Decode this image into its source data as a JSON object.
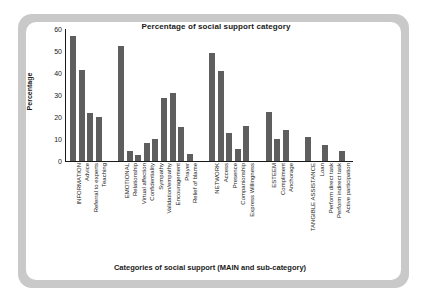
{
  "figure": {
    "background_color": "#ffffff",
    "frame_color": "#c9c9c9",
    "bar_color": "#5e5e5e",
    "axis_color": "#1a1a1a"
  },
  "chart_data": {
    "type": "bar",
    "title": "Percentage of social support category",
    "xlabel": "Categories of social support (MAIN and sub-category)",
    "ylabel": "Percentage",
    "ylim": [
      0,
      60
    ],
    "yticks": [
      0,
      10,
      20,
      30,
      40,
      50,
      60
    ],
    "grid": false,
    "legend": false,
    "categories": [
      "INFORMATION",
      "Advice",
      "Referral to experts",
      "Teaching",
      "EMOTIONAL",
      "Relationship",
      "Virtual affection",
      "Confidentiality",
      "Sympathy",
      "Validation/empathy",
      "Encouragement",
      "Prayer",
      "Relief of blame",
      "NETWORK",
      "Access",
      "Presence",
      "Companionship",
      "Express Willingness",
      "ESTEEM",
      "Compliment",
      "Anchorage",
      "TANGIBLE ASSISTANCE",
      "Loan",
      "Perform direct task",
      "Perform indirect task",
      "Active participation"
    ],
    "values": [
      57,
      41.5,
      22,
      20,
      52.5,
      4.5,
      2.8,
      8,
      9.8,
      28.5,
      30.8,
      15.5,
      3.2,
      49,
      41,
      12.8,
      5.4,
      16,
      22.4,
      10,
      14,
      11,
      0,
      7.5,
      0,
      4.6
    ],
    "group_breaks_after": [
      3,
      12,
      17,
      20
    ]
  }
}
